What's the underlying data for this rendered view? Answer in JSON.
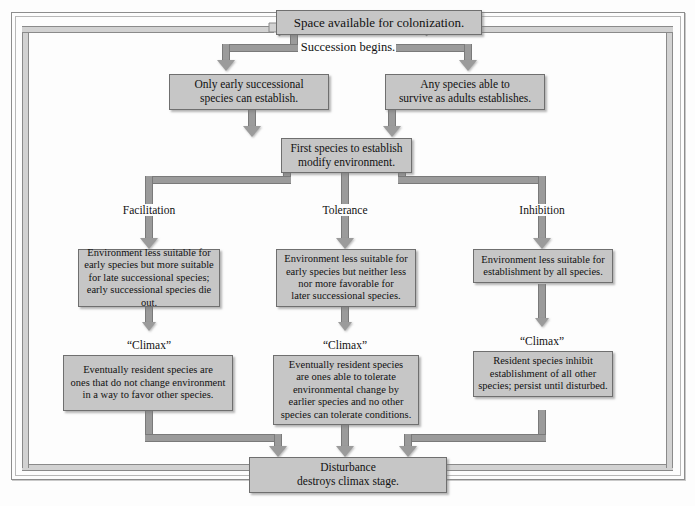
{
  "diagram": {
    "colors": {
      "box_fill": "#c6c6c6",
      "box_border": "#6f6f6f",
      "connector": "#9b9b9b",
      "loop_pipe": "#d2d2d2",
      "text": "#111111",
      "background": "#ffffff"
    },
    "nodes": {
      "start": "Space available for colonization.",
      "succession": "Succession begins.",
      "early_only": "Only early successional species can establish.",
      "any_species": "Any species able to survive as adults establishes.",
      "first_species": "First species to establish modify environment.",
      "facilitation_outcome": "Environment less suitable for early species but more suitable for late successional species; early successional species die out.",
      "tolerance_outcome": "Environment less suitable for early species but neither less nor more favorable for later successional species.",
      "inhibition_outcome": "Environment less suitable for establishment by all species.",
      "facilitation_climax_box": "Eventually resident species are ones that do not change environment in a way to favor other species.",
      "tolerance_climax_box": "Eventually resident species are ones able to tolerate environmental change by earlier species and no other species can tolerate conditions.",
      "inhibition_climax_box": "Resident species inhibit establishment of all other species; persist until disturbed.",
      "disturbance": "Disturbance destroys climax stage."
    },
    "node_lines": {
      "start": [
        "Space available for colonization."
      ],
      "succession": [
        "Succession begins."
      ],
      "early_only": [
        "Only early successional",
        "species can establish."
      ],
      "any_species": [
        "Any species able to",
        "survive as adults establishes."
      ],
      "first_species": [
        "First species to establish",
        "modify environment."
      ],
      "facilitation_outcome": [
        "Environment less suitable for",
        "early species but more suitable",
        "for late successional species;",
        "early successional species die out."
      ],
      "tolerance_outcome": [
        "Environment less suitable for",
        "early species but neither less",
        "nor more favorable for",
        "later successional species."
      ],
      "inhibition_outcome": [
        "Environment less suitable for",
        "establishment by all species."
      ],
      "facilitation_climax_box": [
        "Eventually resident species are",
        "ones that do not change environment",
        "in a way to favor other species."
      ],
      "tolerance_climax_box": [
        "Eventually resident species",
        "are ones able to tolerate",
        "environmental change by",
        "earlier species and no other",
        "species can tolerate conditions."
      ],
      "inhibition_climax_box": [
        "Resident species inhibit",
        "establishment of all other",
        "species; persist until disturbed."
      ],
      "disturbance": [
        "Disturbance",
        "destroys climax stage."
      ]
    },
    "branch_labels": {
      "facilitation": "Facilitation",
      "tolerance": "Tolerance",
      "inhibition": "Inhibition"
    },
    "climax_labels": {
      "left": "“Climax”",
      "center": "“Climax”",
      "right": "“Climax”"
    },
    "edges": [
      {
        "from": "start",
        "to": "early_only",
        "label": "Succession begins."
      },
      {
        "from": "start",
        "to": "any_species",
        "label": "Succession begins."
      },
      {
        "from": "early_only",
        "to": "first_species",
        "label": ""
      },
      {
        "from": "any_species",
        "to": "first_species",
        "label": ""
      },
      {
        "from": "first_species",
        "to": "facilitation_outcome",
        "label": "Facilitation"
      },
      {
        "from": "first_species",
        "to": "tolerance_outcome",
        "label": "Tolerance"
      },
      {
        "from": "first_species",
        "to": "inhibition_outcome",
        "label": "Inhibition"
      },
      {
        "from": "facilitation_outcome",
        "to": "facilitation_climax_box",
        "label": "“Climax”"
      },
      {
        "from": "tolerance_outcome",
        "to": "tolerance_climax_box",
        "label": "“Climax”"
      },
      {
        "from": "inhibition_outcome",
        "to": "inhibition_climax_box",
        "label": "“Climax”"
      },
      {
        "from": "facilitation_climax_box",
        "to": "disturbance",
        "label": ""
      },
      {
        "from": "tolerance_climax_box",
        "to": "disturbance",
        "label": ""
      },
      {
        "from": "inhibition_climax_box",
        "to": "disturbance",
        "label": ""
      },
      {
        "from": "disturbance",
        "to": "start",
        "label": "feedback loop left"
      },
      {
        "from": "disturbance",
        "to": "start",
        "label": "feedback loop right"
      }
    ]
  }
}
